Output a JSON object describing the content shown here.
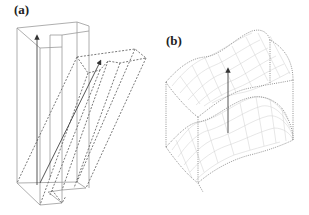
{
  "figure": {
    "panels": [
      {
        "id": "a",
        "label": "(a)",
        "description": "Rectangular U-shaped prism (solid) and a sheared copy (dashed) with translation arrows"
      },
      {
        "id": "b",
        "label": "(b)",
        "description": "Two curved wavy surfaces (upper and lower) with grid mesh connected by dotted vertical edges and an arrow between them"
      }
    ]
  }
}
